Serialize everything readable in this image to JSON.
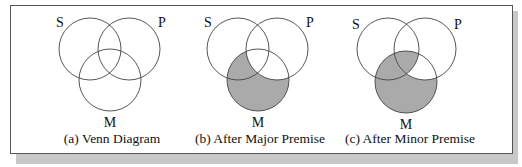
{
  "figure": {
    "panels": [
      {
        "id": "a",
        "caption": "(a) Venn Diagram",
        "labels": {
          "S": "S",
          "P": "P",
          "M": "M"
        },
        "shaded_regions": []
      },
      {
        "id": "b",
        "caption": "(b) After Major Premise",
        "labels": {
          "S": "S",
          "P": "P",
          "M": "M"
        },
        "shaded_regions": [
          "M-not-P"
        ]
      },
      {
        "id": "c",
        "caption": "(c) After Minor Premise",
        "labels": {
          "S": "S",
          "P": "P",
          "M": "M"
        },
        "shaded_regions": [
          "M-not-P",
          "M-and-S-and-P"
        ]
      }
    ],
    "colors": {
      "shade": "#aaaaaa",
      "line": "#444444",
      "shadow": "#c8c8c8"
    }
  }
}
